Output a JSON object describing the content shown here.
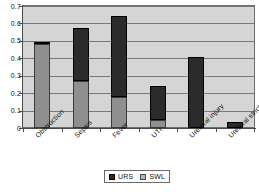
{
  "chart_data": {
    "type": "bar",
    "stacked": true,
    "title": "",
    "xlabel": "",
    "ylabel": "",
    "ylim": [
      0,
      0.7
    ],
    "ytick_labels": [
      "0.7",
      "0.6",
      "0.5",
      "0.4",
      "0.3",
      "0.2",
      "0.1",
      "0"
    ],
    "ytick_values": [
      0.7,
      0.6,
      0.5,
      0.4,
      0.3,
      0.2,
      0.1,
      0
    ],
    "grid": true,
    "legend_position": "bottom",
    "categories": [
      "Obstruction",
      "Sepsis",
      "Fever",
      "UTI",
      "Ureteral injury",
      "Ureteral stricture"
    ],
    "series": [
      {
        "name": "URS",
        "color": "#2b2b2b",
        "values": [
          0.01,
          0.305,
          0.46,
          0.195,
          0.405,
          0.035
        ]
      },
      {
        "name": "SWL",
        "color": "#8f8f8f",
        "values": [
          0.48,
          0.27,
          0.18,
          0.045,
          0.0,
          0.0
        ]
      }
    ],
    "stack_totals": [
      0.49,
      0.575,
      0.64,
      0.24,
      0.405,
      0.035
    ]
  },
  "legend": {
    "items": [
      {
        "label": "URS",
        "swatch": "urs"
      },
      {
        "label": "SWL",
        "swatch": "swl"
      }
    ]
  },
  "colors": {
    "urs": "#2b2b2b",
    "swl": "#8f8f8f",
    "plot_background": "#d5d5d5",
    "gridline": "#7a7a7a",
    "axis": "#4a4a4a"
  }
}
